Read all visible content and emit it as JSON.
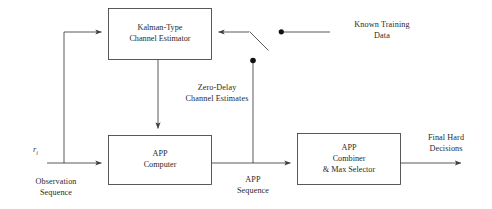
{
  "diagram": {
    "stroke_color": "#3c3c3c",
    "dot_color": "#111111",
    "background": "#ffffff"
  },
  "blocks": [
    {
      "id": "kalman-estimator",
      "line1": "Kalman-Type",
      "line2": "Channel Estimator",
      "line3": ""
    },
    {
      "id": "app-computer",
      "line1": "APP",
      "line2": "Computer",
      "line3": ""
    },
    {
      "id": "app-combiner",
      "line1": "APP",
      "line2": "Combiner",
      "line3": "& Max Selector"
    }
  ],
  "labels": {
    "known_training_l1": "Known Training",
    "known_training_l2": "Data",
    "zero_delay_l1": "Zero-Delay",
    "zero_delay_l2": "Channel Estimates",
    "observation_l1": "Observation",
    "observation_l2": "Sequence",
    "app_sequence_l1": "APP",
    "app_sequence_l2": "Sequence",
    "final_hard_l1": "Final Hard",
    "final_hard_l2": "Decisions",
    "input_signal": "r",
    "input_signal_sub": "i"
  },
  "switch": {
    "name": "training-data-switch",
    "pole_dot_label": "",
    "throw_dot_label": ""
  }
}
